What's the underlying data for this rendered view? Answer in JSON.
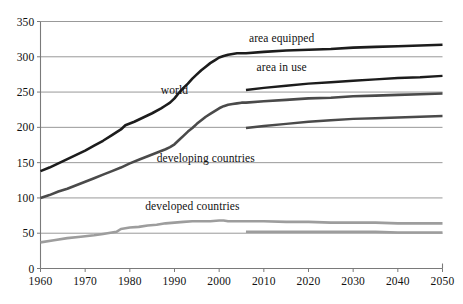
{
  "chart_data": {
    "type": "line",
    "title": "",
    "subtitle": "",
    "xlabel": "",
    "ylabel": "",
    "xlim": [
      1960,
      2050
    ],
    "ylim": [
      0,
      350
    ],
    "grid": true,
    "grid_axis": "y",
    "legend_position": "inline-annotations",
    "y_ticks": [
      0,
      50,
      100,
      150,
      200,
      250,
      300,
      350
    ],
    "x_ticks": [
      1960,
      1970,
      1980,
      1990,
      2000,
      2010,
      2020,
      2030,
      2040,
      2050
    ],
    "annotations": [
      {
        "text": "area equipped",
        "x": 2014,
        "y": 327
      },
      {
        "text": "area in use",
        "x": 2014,
        "y": 286
      },
      {
        "text": "world",
        "x": 1990,
        "y": 253
      },
      {
        "text": "developing countries",
        "x": 1997,
        "y": 157
      },
      {
        "text": "developed countries",
        "x": 1994,
        "y": 88
      }
    ],
    "series": [
      {
        "name": "world area equipped",
        "color": "#1c1c1c",
        "width": 2.6,
        "x": [
          1960,
          1962,
          1964,
          1966,
          1968,
          1970,
          1972,
          1974,
          1976,
          1978,
          1979,
          1981,
          1983,
          1985,
          1987,
          1988,
          1989,
          1990,
          1991,
          1992,
          1993,
          1994,
          1995,
          1996,
          1997,
          1998,
          1999,
          2000,
          2001,
          2002,
          2003,
          2004,
          2005,
          2006,
          2010,
          2015,
          2020,
          2025,
          2030,
          2035,
          2040,
          2045,
          2050
        ],
        "y": [
          138,
          143,
          149,
          155,
          161,
          167,
          174,
          181,
          189,
          197,
          203,
          208,
          214,
          220,
          227,
          231,
          235,
          241,
          249,
          256,
          262,
          269,
          275,
          281,
          286,
          291,
          295,
          299,
          301,
          303,
          304,
          305,
          305,
          305,
          307,
          309,
          310,
          311,
          313,
          314,
          315,
          316,
          317
        ]
      },
      {
        "name": "world area in use",
        "color": "#1c1c1c",
        "width": 2.4,
        "x": [
          2006,
          2010,
          2015,
          2020,
          2025,
          2030,
          2035,
          2040,
          2045,
          2050
        ],
        "y": [
          253,
          256,
          259,
          262,
          264,
          266,
          268,
          270,
          271,
          273
        ]
      },
      {
        "name": "developing countries area equipped",
        "color": "#4a4a4a",
        "width": 2.6,
        "x": [
          1960,
          1962,
          1964,
          1966,
          1968,
          1970,
          1972,
          1974,
          1976,
          1978,
          1980,
          1982,
          1984,
          1986,
          1988,
          1989,
          1990,
          1991,
          1992,
          1993,
          1994,
          1995,
          1996,
          1997,
          1998,
          1999,
          2000,
          2001,
          2002,
          2003,
          2004,
          2005,
          2006,
          2010,
          2015,
          2020,
          2025,
          2030,
          2035,
          2040,
          2045,
          2050
        ],
        "y": [
          100,
          104,
          109,
          113,
          118,
          123,
          128,
          133,
          138,
          143,
          149,
          154,
          159,
          164,
          169,
          172,
          176,
          182,
          188,
          194,
          199,
          205,
          210,
          215,
          219,
          223,
          227,
          230,
          232,
          233,
          234,
          235,
          235,
          237,
          239,
          241,
          242,
          244,
          245,
          246,
          247,
          248
        ]
      },
      {
        "name": "developing countries area in use",
        "color": "#4a4a4a",
        "width": 2.4,
        "x": [
          2006,
          2010,
          2015,
          2020,
          2025,
          2030,
          2035,
          2040,
          2045,
          2050
        ],
        "y": [
          199,
          202,
          205,
          208,
          210,
          212,
          213,
          214,
          215,
          216
        ]
      },
      {
        "name": "developed countries area equipped",
        "color": "#9d9d9d",
        "width": 2.6,
        "x": [
          1960,
          1963,
          1966,
          1969,
          1972,
          1974,
          1976,
          1977,
          1978,
          1980,
          1982,
          1984,
          1986,
          1988,
          1990,
          1992,
          1994,
          1996,
          1998,
          2000,
          2001,
          2002,
          2004,
          2006,
          2010,
          2015,
          2020,
          2025,
          2030,
          2035,
          2040,
          2045,
          2050
        ],
        "y": [
          37,
          40,
          43,
          45,
          47,
          49,
          51,
          52,
          56,
          58,
          59,
          61,
          62,
          64,
          65,
          66,
          67,
          67,
          67,
          68,
          68,
          67,
          67,
          67,
          67,
          66,
          66,
          65,
          65,
          65,
          64,
          64,
          64
        ]
      },
      {
        "name": "developed countries area in use",
        "color": "#9d9d9d",
        "width": 2.4,
        "x": [
          2006,
          2010,
          2015,
          2020,
          2025,
          2030,
          2035,
          2040,
          2045,
          2050
        ],
        "y": [
          52,
          52,
          52,
          52,
          52,
          52,
          52,
          51,
          51,
          51
        ]
      }
    ]
  }
}
